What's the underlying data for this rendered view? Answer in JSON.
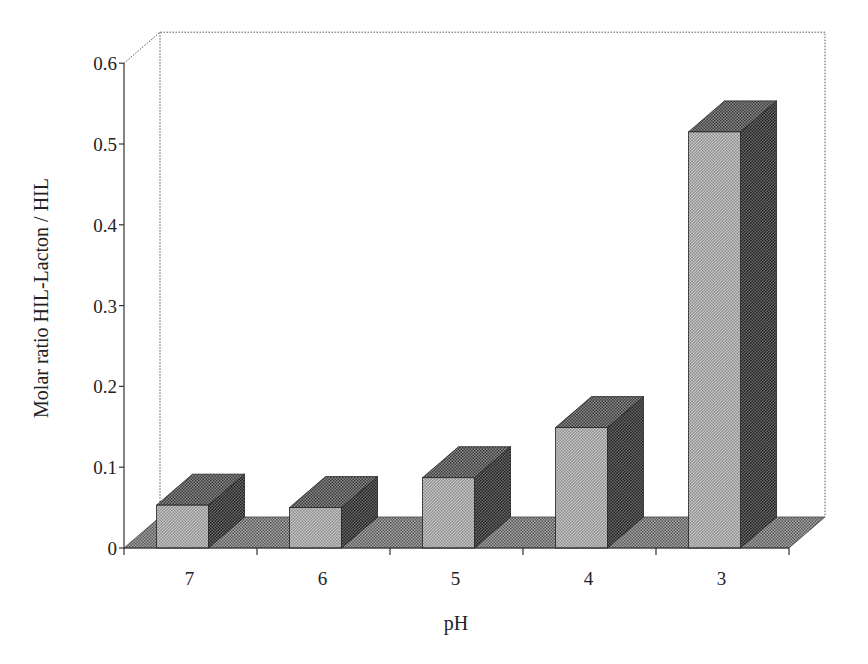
{
  "chart_data": {
    "type": "bar",
    "style": "3d",
    "title": "",
    "xlabel": "pH",
    "ylabel": "Molar ratio HIL-Lacton / HIL",
    "categories": [
      "7",
      "6",
      "5",
      "4",
      "3"
    ],
    "values": [
      0.053,
      0.05,
      0.087,
      0.149,
      0.515
    ],
    "ylim": [
      0,
      0.6
    ],
    "yticks": [
      "0",
      "0.1",
      "0.2",
      "0.3",
      "0.4",
      "0.5",
      "0.6"
    ],
    "grid": false,
    "legend": null
  },
  "colors": {
    "front": "#b4b4b4",
    "top": "#707070",
    "side": "#505050",
    "floor": "#8a8a8a",
    "axis": "#333333"
  }
}
